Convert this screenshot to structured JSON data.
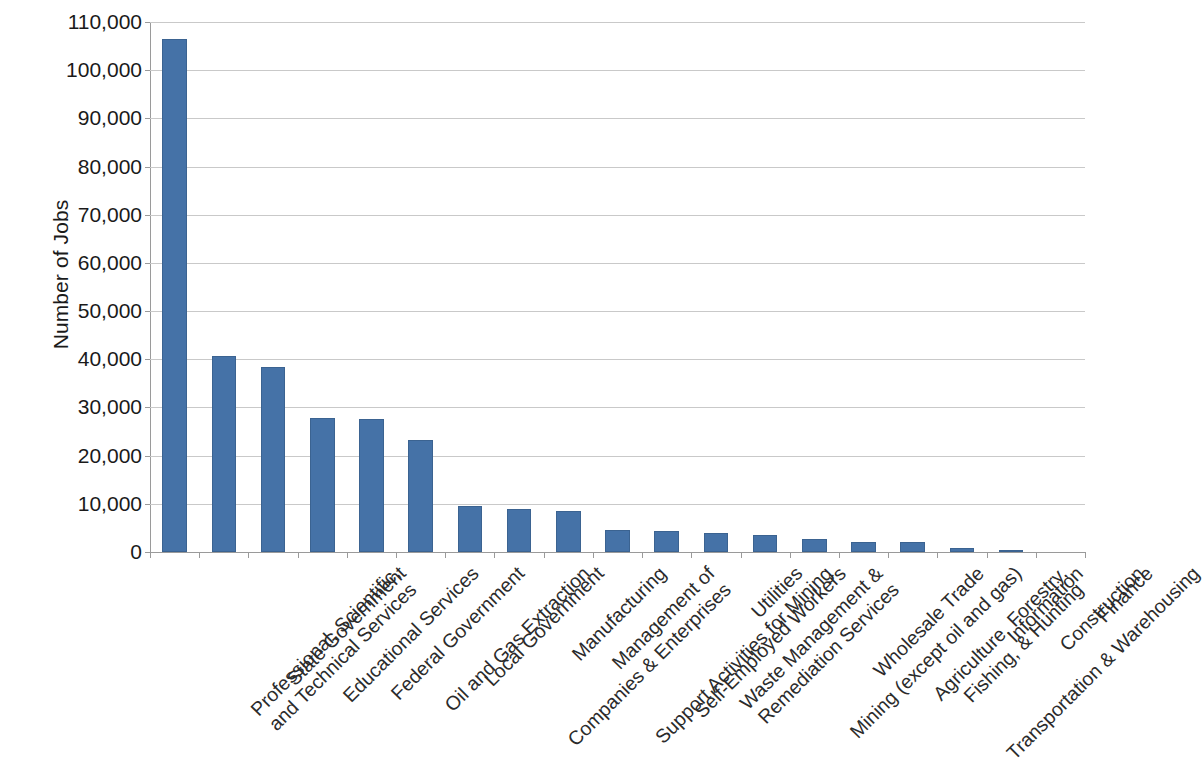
{
  "chart_data": {
    "type": "bar",
    "title": "",
    "subtitle": "",
    "xlabel": "",
    "ylabel": "Number of Jobs",
    "ylim": [
      0,
      110000
    ],
    "ytick_step": 10000,
    "grid": true,
    "legend": "none",
    "bar_color": "#4572A7",
    "bar_border_color": "#3B6391",
    "gridline_color": "#C9C9C9",
    "axis_color": "#9A9A9A",
    "y_tick_labels": [
      "0",
      "10,000",
      "20,000",
      "30,000",
      "40,000",
      "50,000",
      "60,000",
      "70,000",
      "80,000",
      "90,000",
      "100,000",
      "110,000"
    ],
    "y_tick_values": [
      0,
      10000,
      20000,
      30000,
      40000,
      50000,
      60000,
      70000,
      80000,
      90000,
      100000,
      110000
    ],
    "categories": [
      "Professional, Scientific, and Technical Services",
      "State Government",
      "Educational Services",
      "Federal Government",
      "Oil and Gas Extraction",
      "Local Government",
      "Management of Companies & Enterprises",
      "Manufacturing",
      "Support Activities for Mining",
      "Self-Employed Workers",
      "Waste Management & Remediation Services",
      "Utilities",
      "Mining (except oil and gas)",
      "Wholesale Trade",
      "Agriculture, Forestry, Fishing, & Hunting",
      "Transportation & Warehousing",
      "Information",
      "Construction",
      "Finance"
    ],
    "category_lines": [
      [
        "Professional, Scientific,",
        "and Technical Services"
      ],
      [
        "State Government",
        ""
      ],
      [
        "Educational Services",
        ""
      ],
      [
        "Federal Government",
        ""
      ],
      [
        "Oil and Gas Extraction",
        ""
      ],
      [
        "Local Government",
        ""
      ],
      [
        "Management of",
        "Companies & Enterprises"
      ],
      [
        "Manufacturing",
        ""
      ],
      [
        "Support Activities for Mining",
        ""
      ],
      [
        "Self-Employed Workers",
        ""
      ],
      [
        "Waste Management &",
        "Remediation Services"
      ],
      [
        "Utilities",
        ""
      ],
      [
        "Mining (except oil and gas)",
        ""
      ],
      [
        "Wholesale Trade",
        ""
      ],
      [
        "Agriculture, Forestry,",
        "Fishing, & Hunting"
      ],
      [
        "Transportation & Warehousing",
        ""
      ],
      [
        "Information",
        ""
      ],
      [
        "Construction",
        ""
      ],
      [
        "Finance",
        ""
      ]
    ],
    "values": [
      106500,
      40600,
      38500,
      27800,
      27700,
      23200,
      9500,
      9000,
      8500,
      4600,
      4300,
      3900,
      3500,
      2600,
      2100,
      2000,
      800,
      300,
      40
    ]
  }
}
